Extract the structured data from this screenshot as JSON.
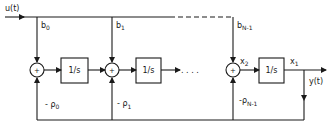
{
  "diagram": {
    "input_label": "u(t)",
    "output_label": "y(t)",
    "dots": ". . . .",
    "integrators": [
      {
        "label": "1/s"
      },
      {
        "label": "1/s"
      },
      {
        "label": "1/s"
      }
    ],
    "summers": [
      {
        "symbol": "+"
      },
      {
        "symbol": "+"
      },
      {
        "symbol": "+"
      }
    ],
    "feedforward_gains": [
      {
        "base": "b",
        "sub": "0"
      },
      {
        "base": "b",
        "sub": "1"
      },
      {
        "base": "b",
        "sub": "N-1"
      }
    ],
    "feedback_gains": [
      {
        "base": "- ρ",
        "sub": "0"
      },
      {
        "base": "- ρ",
        "sub": "1"
      },
      {
        "base": "-ρ",
        "sub": "N-1"
      }
    ],
    "states": [
      {
        "base": "x",
        "sub": "2"
      },
      {
        "base": "x",
        "sub": "1"
      }
    ],
    "colors": {
      "stroke": "#1a1a1a",
      "background": "#ffffff"
    }
  }
}
